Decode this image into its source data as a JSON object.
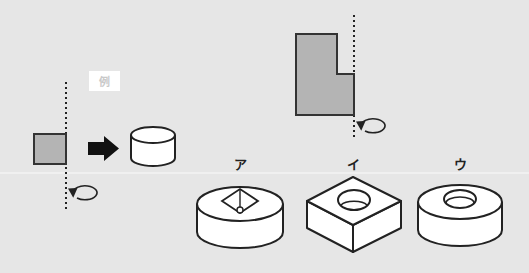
{
  "example": {
    "label": "例",
    "description": "A square rotated about a vertical axis becomes a cylinder"
  },
  "problem": {
    "description": "L-shaped figure rotated about vertical axis on its right edge"
  },
  "choices": [
    {
      "label": "ア",
      "shape": "cylinder-with-square-pyramid-hole"
    },
    {
      "label": "イ",
      "shape": "square-block-with-round-hole"
    },
    {
      "label": "ウ",
      "shape": "cylinder-with-round-hole"
    }
  ],
  "colors": {
    "background": "#e6e6e6",
    "shape_fill": "#b4b4b4",
    "stroke": "#222222",
    "solid_fill": "#ffffff"
  }
}
